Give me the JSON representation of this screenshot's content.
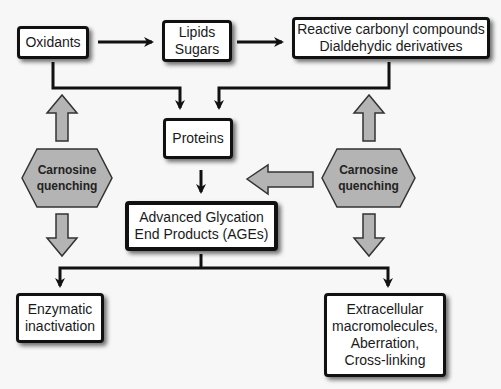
{
  "diagram": {
    "colors": {
      "background": "#f7f7f7",
      "box_fill": "#ffffff",
      "box_border": "#111111",
      "connector": "#111111",
      "quench_fill": "#b4b4b4",
      "quench_border": "#333333"
    },
    "nodes": {
      "oxidants": {
        "lines": [
          "Oxidants"
        ]
      },
      "lipids_sugars": {
        "lines": [
          "Lipids",
          "Sugars"
        ]
      },
      "reactive_carbonyl": {
        "lines": [
          "Reactive carbonyl compounds",
          "Dialdehydic derivatives"
        ]
      },
      "proteins": {
        "lines": [
          "Proteins"
        ]
      },
      "ages": {
        "lines": [
          "Advanced Glycation",
          "End Products (AGEs)"
        ]
      },
      "enzymatic": {
        "lines": [
          "Enzymatic",
          "inactivation"
        ]
      },
      "extracellular": {
        "lines": [
          "Extracellular",
          "macromolecules,",
          "Aberration,",
          "Cross-linking"
        ]
      },
      "quench_left": {
        "lines": [
          "Carnosine",
          "quenching"
        ]
      },
      "quench_right": {
        "lines": [
          "Carnosine",
          "quenching"
        ]
      }
    },
    "edges": [
      {
        "from": "Oxidants",
        "to": "Lipids Sugars",
        "style": "black-arrow"
      },
      {
        "from": "Lipids Sugars",
        "to": "Reactive carbonyl compounds",
        "style": "black-arrow"
      },
      {
        "from": "Oxidants",
        "to": "Proteins",
        "style": "black-arrow"
      },
      {
        "from": "Reactive carbonyl compounds",
        "to": "Proteins",
        "style": "black-arrow"
      },
      {
        "from": "Proteins",
        "to": "AGEs",
        "style": "black-arrow"
      },
      {
        "from": "AGEs",
        "to": "Enzymatic inactivation",
        "style": "black-arrow"
      },
      {
        "from": "AGEs",
        "to": "Extracellular macromolecules",
        "style": "black-arrow"
      },
      {
        "from": "Carnosine quenching (left)",
        "to": "Oxidants path",
        "style": "gray-block-arrow-up"
      },
      {
        "from": "Carnosine quenching (left)",
        "to": "Enzymatic path",
        "style": "gray-block-arrow-down"
      },
      {
        "from": "Carnosine quenching (right)",
        "to": "Reactive carbonyl path",
        "style": "gray-block-arrow-up"
      },
      {
        "from": "Carnosine quenching (right)",
        "to": "Extracellular path",
        "style": "gray-block-arrow-down"
      },
      {
        "from": "Carnosine quenching (right)",
        "to": "Proteins/AGEs",
        "style": "gray-block-arrow-left"
      }
    ]
  }
}
